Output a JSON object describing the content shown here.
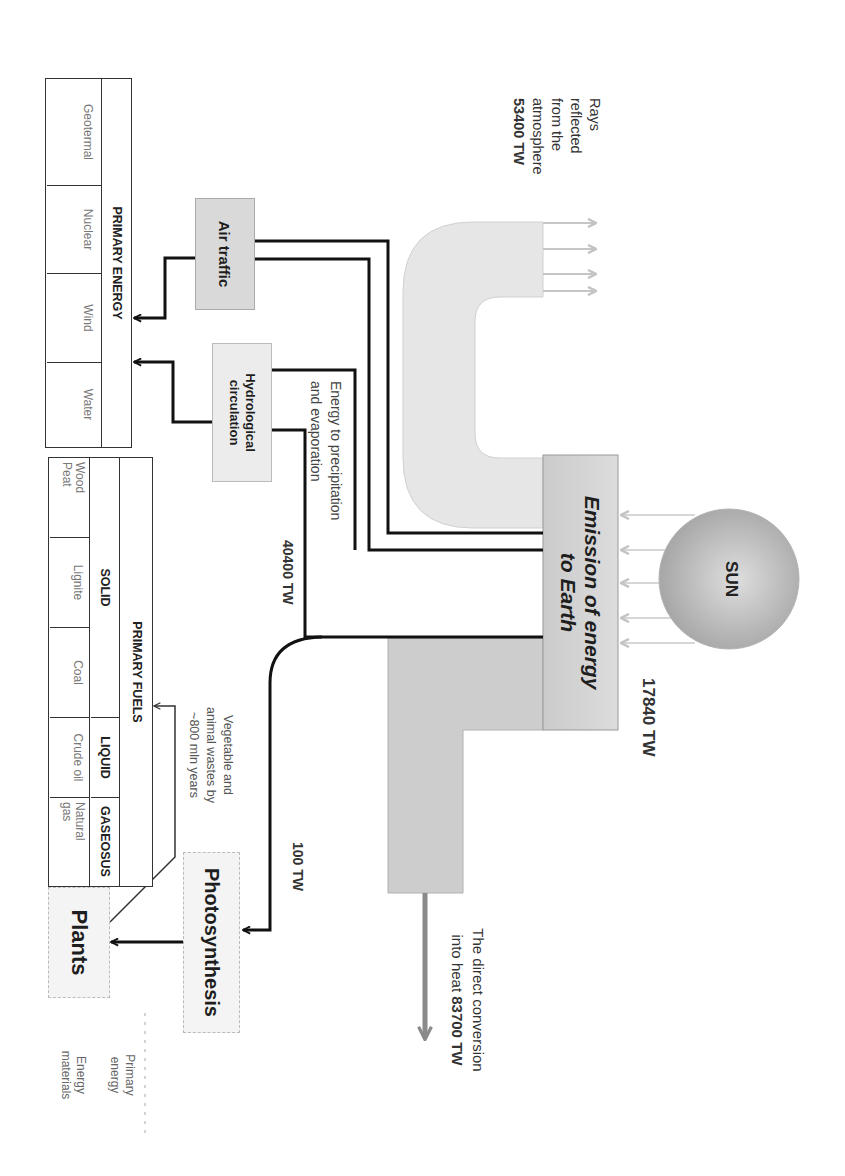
{
  "diagram": {
    "sun": {
      "label": "SUN",
      "output_value": "17840 TW"
    },
    "emission": {
      "line1": "Emission of energy",
      "line2": "to Earth"
    },
    "reflected": {
      "lines": [
        "Rays",
        "reflected",
        "from the",
        "atmosphere"
      ],
      "value": "53400 TW"
    },
    "heat": {
      "line1": "The direct conversion",
      "line2_prefix": "into heat",
      "value": "83700 TW"
    },
    "air_traffic": {
      "label": "Air traffic"
    },
    "hydrological": {
      "line1": "Hydrological",
      "line2": "circulation"
    },
    "precipitation": {
      "line1": "Energy to precipitation",
      "line2": "and evaporation",
      "value": "40400 TW"
    },
    "photosynthesis": {
      "label": "Photosynthesis",
      "value": "100 TW"
    },
    "plants": {
      "label": "Plants"
    },
    "fossil_note": {
      "lines": [
        "Vegetable and",
        "animal wastes by",
        "~800 mln years"
      ]
    },
    "primary_energy_table": {
      "title": "PRIMARY ENERGY",
      "cells": [
        "Geotermal",
        "Nuclear",
        "Wind",
        "Water"
      ]
    },
    "primary_fuels_table": {
      "title": "PRIMARY FUELS",
      "categories": [
        "SOLID",
        "LIQUID",
        "GASEOSUS"
      ],
      "cells": [
        {
          "line1": "Wood",
          "line2": "Peat"
        },
        {
          "line1": "Lignite"
        },
        {
          "line1": "Coal"
        },
        {
          "line1": "Crude oil"
        },
        {
          "line1": "Natural",
          "line2": "gas"
        }
      ]
    },
    "legend": {
      "primary_energy": {
        "line1": "Primary",
        "line2": "energy"
      },
      "energy_materials": {
        "line1": "Energy",
        "line2": "materials"
      }
    }
  },
  "colors": {
    "sun_center": "#dcdcdc",
    "sun_edge": "#a9a9a9",
    "emission_box": "#d4d4d4",
    "reflected_band": "#e6e6e6",
    "heat_band": "#cdcdcd",
    "heat_arrow": "#8a8a8a",
    "flow_line": "#111111",
    "ray": "#c6c6c6"
  }
}
